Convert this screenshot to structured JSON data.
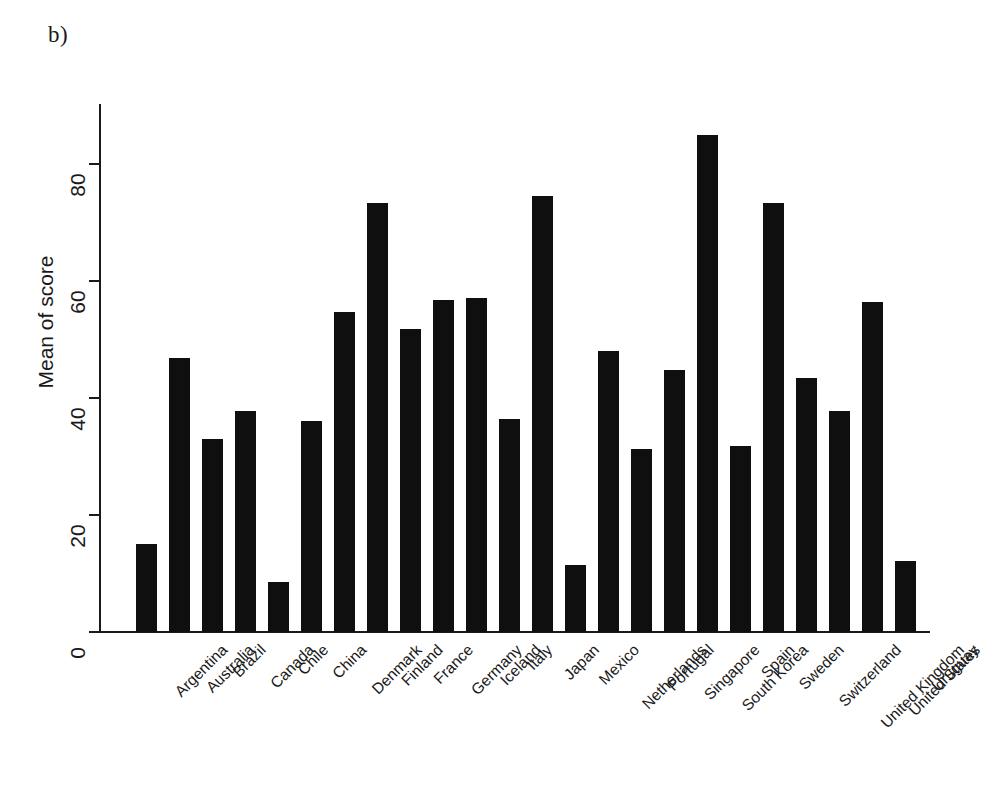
{
  "figure": {
    "panel_label": "b)"
  },
  "chart_data": {
    "type": "bar",
    "title": "",
    "subtitle": "",
    "xlabel": "",
    "ylabel": "Mean of score",
    "ylim": [
      0,
      90
    ],
    "yticks": [
      0,
      20,
      40,
      60,
      80
    ],
    "ytick_labels": [
      "0",
      "20",
      "40",
      "60",
      "80"
    ],
    "grid": false,
    "legend": null,
    "bar_color": "#100f0f",
    "axis_color": "#1a1a1a",
    "background": "#ffffff",
    "categories": [
      "Argentina",
      "Australia",
      "Brazil",
      "Canada",
      "Chile",
      "China",
      "Denmark",
      "Finland",
      "France",
      "Germany",
      "Iceland",
      "Italy",
      "Japan",
      "Mexico",
      "Netherlands",
      "Portugal",
      "Singapore",
      "South Korea",
      "Spain",
      "Sweden",
      "Switzerland",
      "United Kingdom",
      "United States",
      "Uruguay"
    ],
    "values": [
      15.0,
      46.8,
      33.0,
      37.7,
      8.5,
      36.1,
      54.7,
      73.3,
      51.8,
      56.7,
      57.0,
      36.3,
      74.5,
      11.5,
      48.0,
      31.3,
      44.8,
      84.8,
      31.8,
      73.3,
      43.3,
      37.7,
      56.3,
      12.1
    ]
  }
}
